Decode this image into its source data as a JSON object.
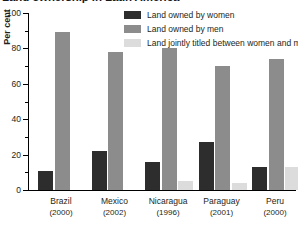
{
  "chart_data": {
    "type": "bar",
    "title": "Land ownership in Latin America",
    "xlabel": "",
    "ylabel": "Per cent",
    "ylim": [
      0,
      100
    ],
    "ytick_labels": [
      "100",
      "80",
      "60",
      "40",
      "20",
      "0"
    ],
    "ytick_values": [
      100,
      80,
      60,
      40,
      20,
      0
    ],
    "minor_tick_values": [
      90,
      70,
      50,
      30,
      10
    ],
    "grid": false,
    "legend_position": "top-right",
    "categories": [
      "Brazil",
      "Mexico",
      "Nicaragua",
      "Paraguay",
      "Peru"
    ],
    "category_years": [
      "(2000)",
      "(2002)",
      "(1996)",
      "(2001)",
      "(2000)"
    ],
    "category_labels": [
      "Brazil\n(2000)",
      "Mexico\n(2002)",
      "Nicaragua\n(1996)",
      "Paraguay\n(2001)",
      "Peru\n(2000)"
    ],
    "series": [
      {
        "name": "Land owned by women",
        "color": "#2d2d2d",
        "values": [
          11,
          22,
          16,
          27,
          13
        ]
      },
      {
        "name": "Land owned by men",
        "color": "#8c8c8c",
        "values": [
          89,
          78,
          80,
          70,
          74
        ]
      },
      {
        "name": "Land jointly titled between women and men",
        "color": "#dcdcdc",
        "values": [
          0,
          0,
          5,
          4,
          13
        ]
      }
    ]
  },
  "legend": {
    "items": [
      {
        "label": "Land owned by women",
        "color": "#2d2d2d"
      },
      {
        "label": "Land owned by men",
        "color": "#8c8c8c"
      },
      {
        "label": "Land jointly titled between women and men",
        "color": "#dcdcdc"
      }
    ]
  },
  "colors": {
    "women": "#2d2d2d",
    "men": "#8c8c8c",
    "joint": "#dcdcdc",
    "axis": "#000000",
    "text": "#231f20",
    "background": "#ffffff"
  }
}
